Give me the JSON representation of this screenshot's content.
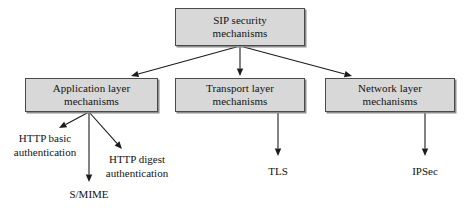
{
  "diagram": {
    "title_node": {
      "id": "sip-security-mechanisms",
      "lines": [
        "SIP security",
        "mechanisms"
      ],
      "x": 175,
      "y": 8,
      "w": 130,
      "h": 38
    },
    "layer_nodes": [
      {
        "id": "application-layer-mechanisms",
        "lines": [
          "Application layer",
          "mechanisms"
        ],
        "x": 25,
        "y": 78,
        "w": 133,
        "h": 34
      },
      {
        "id": "transport-layer-mechanisms",
        "lines": [
          "Transport layer",
          "mechanisms"
        ],
        "x": 175,
        "y": 78,
        "w": 130,
        "h": 34
      },
      {
        "id": "network-layer-mechanisms",
        "lines": [
          "Network layer",
          "mechanisms"
        ],
        "x": 325,
        "y": 78,
        "w": 130,
        "h": 34
      }
    ],
    "leaf_nodes": [
      {
        "id": "http-basic-authentication",
        "lines": [
          "HTTP basic",
          "authentication"
        ],
        "cx": 45,
        "y": 131
      },
      {
        "id": "http-digest-authentication",
        "lines": [
          "HTTP digest",
          "authentication"
        ],
        "cx": 137,
        "y": 152
      },
      {
        "id": "s-mime",
        "lines": [
          "S/MIME"
        ],
        "cx": 89,
        "y": 187
      },
      {
        "id": "tls",
        "lines": [
          "TLS"
        ],
        "cx": 278,
        "y": 164
      },
      {
        "id": "ipsec",
        "lines": [
          "IPSec"
        ],
        "cx": 425,
        "y": 164
      }
    ],
    "edges": [
      {
        "id": "edge-sip-to-application",
        "from": "sip-security-mechanisms",
        "to": "application-layer-mechanisms",
        "x1": 240,
        "y1": 46,
        "x2": 131,
        "y2": 76
      },
      {
        "id": "edge-sip-to-transport",
        "from": "sip-security-mechanisms",
        "to": "transport-layer-mechanisms",
        "x1": 240,
        "y1": 46,
        "x2": 240,
        "y2": 76
      },
      {
        "id": "edge-sip-to-network",
        "from": "sip-security-mechanisms",
        "to": "network-layer-mechanisms",
        "x1": 240,
        "y1": 46,
        "x2": 352,
        "y2": 76
      },
      {
        "id": "edge-application-to-http-basic",
        "from": "application-layer-mechanisms",
        "to": "http-basic-authentication",
        "x1": 89,
        "y1": 112,
        "x2": 59,
        "y2": 128
      },
      {
        "id": "edge-application-to-s-mime",
        "from": "application-layer-mechanisms",
        "to": "s-mime",
        "x1": 89,
        "y1": 112,
        "x2": 89,
        "y2": 182
      },
      {
        "id": "edge-application-to-http-digest",
        "from": "application-layer-mechanisms",
        "to": "http-digest-authentication",
        "x1": 89,
        "y1": 112,
        "x2": 122,
        "y2": 149
      },
      {
        "id": "edge-transport-to-tls",
        "from": "transport-layer-mechanisms",
        "to": "tls",
        "x1": 278,
        "y1": 112,
        "x2": 278,
        "y2": 156
      },
      {
        "id": "edge-network-to-ipsec",
        "from": "network-layer-mechanisms",
        "to": "ipsec",
        "x1": 425,
        "y1": 112,
        "x2": 425,
        "y2": 156
      }
    ],
    "colors": {
      "box_fill": "#d8d8d8",
      "box_border": "#4a4a4a",
      "box_shadow": "#8d8d8d",
      "edge": "#1c1c1c",
      "text": "#121212",
      "background": "#ffffff"
    }
  }
}
